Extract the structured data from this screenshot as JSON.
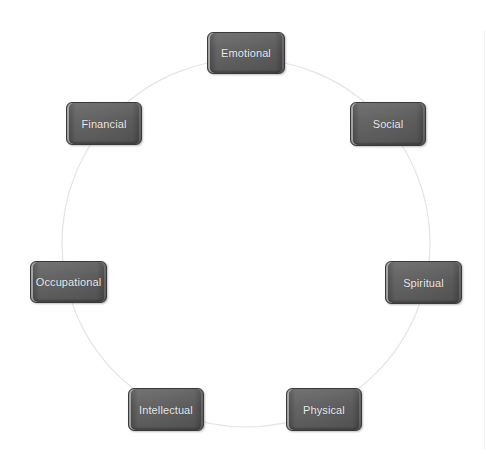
{
  "diagram": {
    "type": "cycle",
    "ring": {
      "color": "#e6e6e6",
      "cx": 246,
      "cy": 243,
      "r": 184
    },
    "node_style": {
      "fill": "#5f5f5f",
      "text_color": "#ececec"
    },
    "nodes": [
      {
        "label": "Emotional"
      },
      {
        "label": "Social"
      },
      {
        "label": "Spiritual"
      },
      {
        "label": "Physical"
      },
      {
        "label": "Intellectual"
      },
      {
        "label": "Occupational"
      },
      {
        "label": "Financial"
      }
    ]
  }
}
